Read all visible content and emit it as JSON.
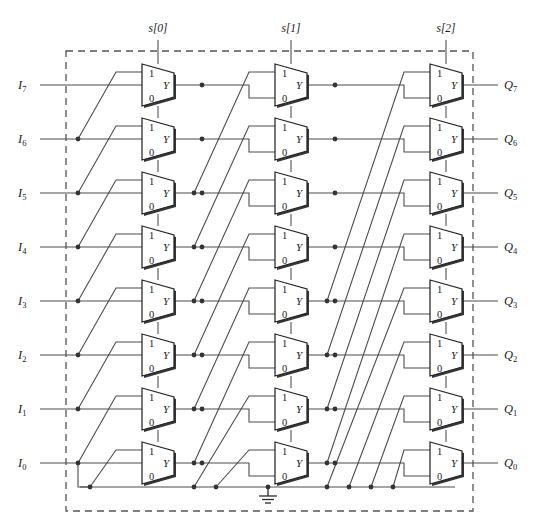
{
  "figure": {
    "kind": "logic-schematic",
    "name": "8-bit barrel shifter / rotator built from three stages of 2:1 multiplexers",
    "stage_count": 3,
    "bit_width": 8
  },
  "select_lines": [
    {
      "id": "s0",
      "label": "s[0]",
      "stage": 1,
      "shift_amount": 1,
      "x": 158
    },
    {
      "id": "s1",
      "label": "s[1]",
      "stage": 2,
      "shift_amount": 2,
      "x": 291
    },
    {
      "id": "s2",
      "label": "s[2]",
      "stage": 3,
      "shift_amount": 4,
      "x": 446
    }
  ],
  "inputs": [
    {
      "label": "I",
      "sub": "7",
      "index": 7,
      "y": 85
    },
    {
      "label": "I",
      "sub": "6",
      "index": 6,
      "y": 139
    },
    {
      "label": "I",
      "sub": "5",
      "index": 5,
      "y": 193
    },
    {
      "label": "I",
      "sub": "4",
      "index": 4,
      "y": 247
    },
    {
      "label": "I",
      "sub": "3",
      "index": 3,
      "y": 301
    },
    {
      "label": "I",
      "sub": "2",
      "index": 2,
      "y": 355
    },
    {
      "label": "I",
      "sub": "1",
      "index": 1,
      "y": 409
    },
    {
      "label": "I",
      "sub": "0",
      "index": 0,
      "y": 463
    }
  ],
  "outputs": [
    {
      "label": "Q",
      "sub": "7",
      "index": 7,
      "y": 85
    },
    {
      "label": "Q",
      "sub": "6",
      "index": 6,
      "y": 139
    },
    {
      "label": "Q",
      "sub": "5",
      "index": 5,
      "y": 193
    },
    {
      "label": "Q",
      "sub": "4",
      "index": 4,
      "y": 247
    },
    {
      "label": "Q",
      "sub": "3",
      "index": 3,
      "y": 301
    },
    {
      "label": "Q",
      "sub": "2",
      "index": 2,
      "y": 355
    },
    {
      "label": "Q",
      "sub": "1",
      "index": 1,
      "y": 409
    },
    {
      "label": "Q",
      "sub": "0",
      "index": 0,
      "y": 463
    }
  ],
  "mux": {
    "pin_one_label": "1",
    "pin_zero_label": "0",
    "out_label": "Y",
    "type": "2-to-1 multiplexer",
    "total_count": 24
  },
  "ground": {
    "symbol": "ground",
    "label": "",
    "x": 268,
    "rail_y": 487
  },
  "boundary": {
    "style": "dashed",
    "x": 66,
    "y": 51,
    "width": 407,
    "height": 460
  },
  "colors": {
    "wire": "#4d4d4d",
    "mux_outline": "#262626",
    "boundary": "#555555",
    "background": "#ffffff",
    "text": "#1a1a1a"
  },
  "chart_data": {
    "type": "diagram",
    "title": "",
    "stages": [
      {
        "stage": 1,
        "select": "s[0]",
        "shift": 1,
        "mux_x": 158,
        "connections": "Each mux 0-input takes row n; 1-input takes row n-1 (one row below); rows below the bottom take ground."
      },
      {
        "stage": 2,
        "select": "s[1]",
        "shift": 2,
        "mux_x": 291,
        "connections": "Each mux 0-input takes stage-1 row n; 1-input takes stage-1 row n-2; rows below the bottom take ground."
      },
      {
        "stage": 3,
        "select": "s[2]",
        "shift": 4,
        "mux_x": 446,
        "connections": "Each mux 0-input takes stage-2 row n; 1-input takes stage-2 row n-4; rows below the bottom take ground."
      }
    ]
  }
}
